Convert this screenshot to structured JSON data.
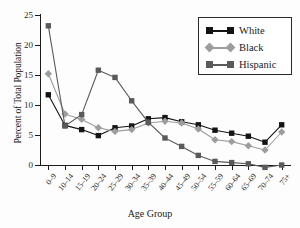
{
  "chart_data": {
    "type": "line",
    "title": "",
    "xlabel": "Age Group",
    "ylabel": "Percent of Total Population",
    "categories": [
      "0–9",
      "10–14",
      "15–19",
      "20–24",
      "25–29",
      "30–34",
      "35–39",
      "40–44",
      "45–49",
      "50–54",
      "55–59",
      "60–64",
      "65–69",
      "70–74",
      "75+"
    ],
    "yticks": [
      0,
      5,
      10,
      15,
      20,
      25
    ],
    "ylim": [
      0,
      25
    ],
    "grid": false,
    "legend_position": "top-right",
    "series": [
      {
        "name": "White",
        "color": "#141414",
        "marker": "square",
        "values": [
          11.7,
          6.6,
          5.9,
          4.9,
          6.2,
          6.5,
          7.7,
          7.9,
          7.2,
          6.7,
          5.8,
          5.3,
          4.8,
          3.8,
          6.7
        ]
      },
      {
        "name": "Black",
        "color": "#9d9d9d",
        "marker": "diamond",
        "values": [
          15.2,
          8.5,
          7.6,
          6.2,
          5.6,
          5.9,
          7.0,
          7.3,
          7.0,
          6.0,
          4.2,
          3.9,
          3.2,
          2.5,
          5.5
        ]
      },
      {
        "name": "Hispanic",
        "color": "#5a5a5a",
        "marker": "square",
        "values": [
          23.2,
          6.5,
          8.4,
          15.8,
          14.6,
          10.7,
          7.1,
          4.5,
          3.1,
          1.6,
          0.6,
          0.4,
          0.2,
          -0.4,
          0.0
        ]
      }
    ]
  },
  "legend": {
    "items": [
      {
        "label": "White"
      },
      {
        "label": "Black"
      },
      {
        "label": "Hispanic"
      }
    ]
  },
  "axes": {
    "x_title": "Age Group",
    "y_title": "Percent of Total Population"
  }
}
